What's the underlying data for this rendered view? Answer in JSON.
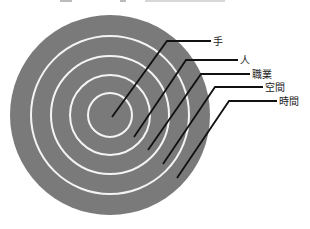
{
  "diagram": {
    "type": "concentric-circles",
    "colors": {
      "disk": "#7a7a7a",
      "ring": "#f4f4f4",
      "leader": "#111111",
      "text": "#222222",
      "background": "#ffffff"
    },
    "center": [
      110,
      115
    ],
    "disk_radius": 100,
    "ring_radii": [
      22,
      40,
      59,
      79
    ],
    "layers": [
      {
        "label": "手",
        "target": [
          112,
          117
        ],
        "elbow": [
          167,
          41
        ],
        "end": [
          211,
          41
        ],
        "text_pos": [
          213,
          45
        ]
      },
      {
        "label": "人",
        "target": [
          134,
          137
        ],
        "elbow": [
          186,
          60
        ],
        "end": [
          238,
          60
        ],
        "text_pos": [
          240,
          64
        ]
      },
      {
        "label": "職業",
        "target": [
          148,
          150
        ],
        "elbow": [
          201,
          74
        ],
        "end": [
          250,
          74
        ],
        "text_pos": [
          252,
          78
        ]
      },
      {
        "label": "空間",
        "target": [
          163,
          164
        ],
        "elbow": [
          215,
          87
        ],
        "end": [
          263,
          87
        ],
        "text_pos": [
          265,
          91
        ]
      },
      {
        "label": "時間",
        "target": [
          177,
          178
        ],
        "elbow": [
          229,
          101
        ],
        "end": [
          277,
          101
        ],
        "text_pos": [
          279,
          105
        ]
      }
    ]
  }
}
